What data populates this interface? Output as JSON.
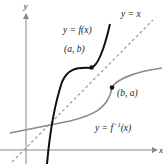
{
  "figure": {
    "axes": {
      "x_label": "x",
      "y_label": "y"
    },
    "curves": {
      "f": {
        "label_prefix": "y = ",
        "label_func": "f",
        "label_arg": "(x)",
        "color": "#111111"
      },
      "f_inverse": {
        "label_prefix": "y = ",
        "label_func": "f",
        "label_sup": "−1",
        "label_arg": "(x)",
        "color": "#8a8a8a"
      },
      "identity": {
        "label": "y = x",
        "color": "#9a9a9a",
        "style": "dashed"
      }
    },
    "points": [
      {
        "name": "point-a-b",
        "label": "(a, b)"
      },
      {
        "name": "point-b-a",
        "label": "(b, a)"
      }
    ],
    "colors": {
      "axis": "#888888",
      "text": "#222222",
      "background": "#ffffff"
    }
  }
}
